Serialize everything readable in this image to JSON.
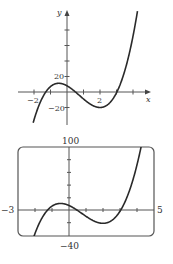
{
  "chart_data": [
    {
      "type": "line",
      "title": "",
      "xlabel": "x",
      "ylabel": "y",
      "function_estimate": "f(x) = 4x^3 - 9x^2 - 12x + 8",
      "xlim": [
        -3,
        5
      ],
      "ylim": [
        -40,
        110
      ],
      "x_ticks": [
        -2,
        -1,
        0,
        1,
        2,
        3,
        4
      ],
      "x_tick_labels": [
        "-2",
        "2"
      ],
      "y_ticks": [
        -20,
        20,
        40,
        60,
        80,
        100
      ],
      "y_tick_labels": [
        "20",
        "-20"
      ],
      "grid": false,
      "series": [
        {
          "name": "f(x)",
          "x": [
            -2,
            -1.5,
            -1,
            -0.5,
            0,
            0.5,
            1,
            1.5,
            2,
            2.5,
            3,
            3.5,
            4,
            4.2
          ],
          "y": [
            -40,
            -7.75,
            7,
            11.25,
            8,
            -0.75,
            -9,
            -17,
            -20,
            -14.75,
            -1,
            23.75,
            72,
            95
          ]
        }
      ]
    },
    {
      "type": "line",
      "title": "Graphing calculator viewing window [-3,5] by [-40,100]",
      "xlabel": "",
      "ylabel": "",
      "xlim": [
        -3,
        5
      ],
      "ylim": [
        -40,
        100
      ],
      "window_labels": {
        "xmin": "−3",
        "xmax": "5",
        "ymin": "−40",
        "ymax": "100"
      },
      "grid": false,
      "series": [
        {
          "name": "f(x)",
          "x": [
            -2.05,
            -1.5,
            -1,
            -0.5,
            0,
            0.5,
            1,
            1.5,
            2,
            2.5,
            3,
            3.5,
            4,
            4.18
          ],
          "y": [
            -40,
            -7.75,
            7,
            11.25,
            8,
            -0.75,
            -9,
            -17,
            -20,
            -14.75,
            -1,
            23.75,
            72,
            100
          ]
        }
      ]
    }
  ],
  "top_graph": {
    "x_axis_label": "x",
    "y_axis_label": "y",
    "x_tick_label_neg": "−2",
    "x_tick_label_pos": "2",
    "y_tick_label_pos": "20",
    "y_tick_label_neg": "−20"
  },
  "bottom_graph": {
    "ymax_label": "100",
    "ymin_label": "−40",
    "xmin_label": "−3",
    "xmax_label": "5"
  },
  "colors": {
    "curve": "#2a2a2a",
    "axis": "#555555",
    "frame": "#555555"
  }
}
